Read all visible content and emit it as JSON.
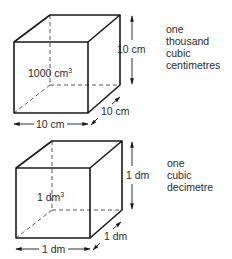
{
  "figures": [
    {
      "id": "cube-cm",
      "volume_label": "1000 cm",
      "volume_superscript": "3",
      "height_label": "10 cm",
      "width_label": "10 cm",
      "depth_label": "10 cm",
      "description": [
        "one",
        "thousand",
        "cubic",
        "centimetres"
      ]
    },
    {
      "id": "cube-dm",
      "volume_label": "1 dm",
      "volume_superscript": "3",
      "height_label": "1 dm",
      "width_label": "1 dm",
      "depth_label": "1 dm",
      "description": [
        "one",
        "cubic",
        "decimetre"
      ]
    }
  ],
  "colors": {
    "line": "#1a1a1a",
    "text": "#2a2a2a",
    "background": "#ffffff"
  }
}
